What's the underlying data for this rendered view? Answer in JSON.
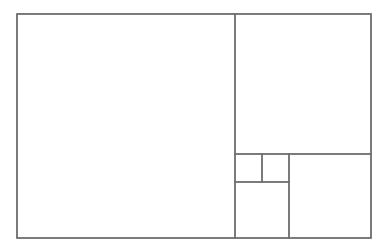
{
  "diagram": {
    "type": "fibonacci-rectangle-tiling",
    "stroke_color": "#6e6e6e",
    "background_color": "#ffffff",
    "outer_rect": {
      "x": 17,
      "y": 14,
      "width": 354,
      "height": 224
    },
    "tiles": [
      {
        "name": "square-large-left",
        "x": 17,
        "y": 14,
        "width": 218,
        "height": 224
      },
      {
        "name": "square-top-right",
        "x": 235,
        "y": 14,
        "width": 136,
        "height": 140
      },
      {
        "name": "square-bottom-right",
        "x": 289,
        "y": 154,
        "width": 82,
        "height": 84
      },
      {
        "name": "square-bottom-middle",
        "x": 235,
        "y": 182,
        "width": 54,
        "height": 56
      },
      {
        "name": "square-small-a",
        "x": 235,
        "y": 154,
        "width": 27,
        "height": 28
      },
      {
        "name": "square-small-b",
        "x": 262,
        "y": 154,
        "width": 27,
        "height": 28
      }
    ]
  }
}
